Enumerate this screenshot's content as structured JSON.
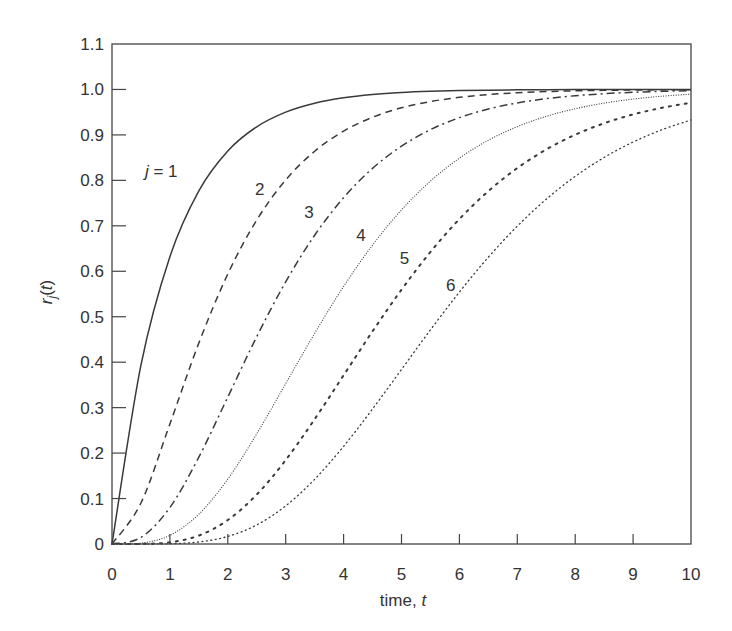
{
  "chart_data": {
    "type": "line",
    "title": "",
    "xlabel": "time, t",
    "ylabel": "r_j(t)",
    "xlim": [
      0,
      10
    ],
    "ylim": [
      0,
      1.1
    ],
    "grid": false,
    "legend": "inline curve labels",
    "xticks": [
      "0",
      "1",
      "2",
      "3",
      "4",
      "5",
      "6",
      "7",
      "8",
      "9",
      "10"
    ],
    "yticks": [
      "0",
      "0.1",
      "0.2",
      "0.3",
      "0.4",
      "0.5",
      "0.6",
      "0.7",
      "0.8",
      "0.9",
      "1.0",
      "1.1"
    ],
    "x": [
      0,
      0.5,
      1,
      1.5,
      2,
      2.5,
      3,
      3.5,
      4,
      4.5,
      5,
      5.5,
      6,
      6.5,
      7,
      7.5,
      8,
      8.5,
      9,
      9.5,
      10
    ],
    "series": [
      {
        "name": "j = 1",
        "label": "j = 1",
        "style": "solid",
        "values": [
          0,
          0.3935,
          0.6321,
          0.7769,
          0.8647,
          0.9179,
          0.9502,
          0.9698,
          0.9817,
          0.9889,
          0.9933,
          0.9959,
          0.9975,
          0.9985,
          0.9991,
          0.9994,
          0.9997,
          0.9998,
          0.9999,
          0.9999,
          1.0
        ]
      },
      {
        "name": "j = 2",
        "label": "2",
        "style": "dashed",
        "values": [
          0,
          0.0902,
          0.2642,
          0.4422,
          0.594,
          0.7127,
          0.8009,
          0.8641,
          0.9084,
          0.9389,
          0.9596,
          0.9734,
          0.9826,
          0.9887,
          0.9927,
          0.9953,
          0.997,
          0.9981,
          0.9988,
          0.9992,
          0.9995
        ]
      },
      {
        "name": "j = 3",
        "label": "3",
        "style": "dash-dot",
        "values": [
          0,
          0.0144,
          0.0803,
          0.1912,
          0.3233,
          0.4562,
          0.5768,
          0.6792,
          0.7619,
          0.8264,
          0.8753,
          0.9116,
          0.938,
          0.957,
          0.9704,
          0.9797,
          0.9862,
          0.9907,
          0.9938,
          0.9958,
          0.9972
        ]
      },
      {
        "name": "j = 4",
        "label": "4",
        "style": "fine-dotted",
        "values": [
          0,
          0.0018,
          0.019,
          0.0656,
          0.1429,
          0.2424,
          0.3528,
          0.4634,
          0.5665,
          0.6577,
          0.735,
          0.7983,
          0.8488,
          0.8882,
          0.9182,
          0.9409,
          0.9576,
          0.9699,
          0.9788,
          0.9851,
          0.9897
        ]
      },
      {
        "name": "j = 5",
        "label": "5",
        "style": "dotted",
        "values": [
          0,
          0.0002,
          0.0037,
          0.0186,
          0.0527,
          0.1088,
          0.1847,
          0.2746,
          0.3712,
          0.4679,
          0.5595,
          0.6425,
          0.7149,
          0.7763,
          0.827,
          0.8679,
          0.9004,
          0.9256,
          0.945,
          0.9597,
          0.9707
        ]
      },
      {
        "name": "j = 6",
        "label": "6",
        "style": "light-dotted",
        "values": [
          0,
          0.0,
          0.0006,
          0.0045,
          0.0166,
          0.042,
          0.0839,
          0.1424,
          0.2149,
          0.2971,
          0.384,
          0.4711,
          0.5543,
          0.631,
          0.6993,
          0.7586,
          0.8088,
          0.8504,
          0.8843,
          0.9115,
          0.9329
        ]
      }
    ],
    "annotations": [
      {
        "text": "j = 1",
        "x": 0.85,
        "y": 0.82
      },
      {
        "text": "2",
        "x": 2.55,
        "y": 0.78
      },
      {
        "text": "3",
        "x": 3.4,
        "y": 0.73
      },
      {
        "text": "4",
        "x": 4.3,
        "y": 0.68
      },
      {
        "text": "5",
        "x": 5.05,
        "y": 0.63
      },
      {
        "text": "6",
        "x": 5.85,
        "y": 0.57
      }
    ]
  }
}
